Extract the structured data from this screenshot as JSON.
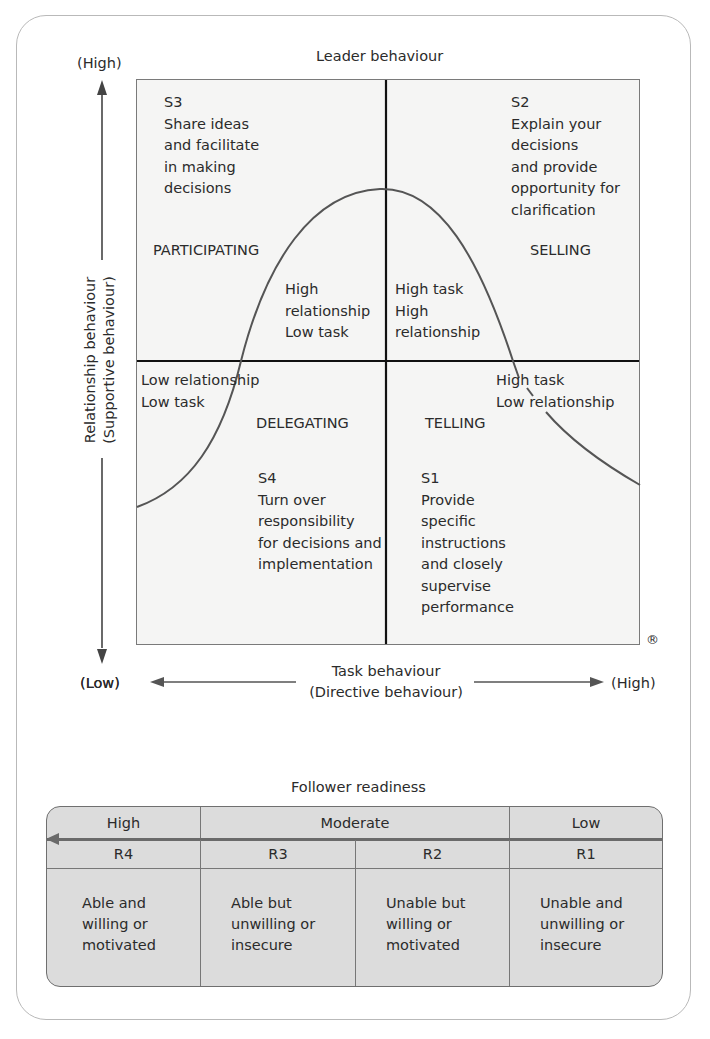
{
  "diagram": {
    "title": "Leader behaviour",
    "y_axis": {
      "label_line1": "Relationship behaviour",
      "label_line2": "(Supportive behaviour)",
      "high": "(High)",
      "low": "(Low)"
    },
    "x_axis": {
      "label_line1": "Task behaviour",
      "label_line2": "(Directive behaviour)",
      "low": "(Low)",
      "high": "(High)"
    },
    "registered_mark": "®",
    "quadrants": {
      "s3": {
        "code": "S3",
        "description": "Share ideas\nand facilitate\nin making\ndecisions",
        "style": "PARTICIPATING",
        "curve_label": "High\nrelationship\nLow task"
      },
      "s2": {
        "code": "S2",
        "description": "Explain your\ndecisions\nand provide\nopportunity for\nclarification",
        "style": "SELLING",
        "curve_label": "High task\nHigh\nrelationship"
      },
      "s4": {
        "code": "S4",
        "description": "Turn over\nresponsibility\nfor decisions and\nimplementation",
        "style": "DELEGATING",
        "curve_label": "Low relationship\nLow task"
      },
      "s1": {
        "code": "S1",
        "description": "Provide\nspecific\ninstructions\nand closely\nsupervise\nperformance",
        "style": "TELLING",
        "curve_label": "High task\nLow  relationship"
      }
    },
    "colors": {
      "grid_bg": "#f5f5f4",
      "curve": "#555555",
      "axis": "#111111",
      "table_bg": "#dcdcdc"
    }
  },
  "follower_readiness": {
    "title": "Follower readiness",
    "levels": [
      "High",
      "Moderate",
      "Low"
    ],
    "codes": [
      "R4",
      "R3",
      "R2",
      "R1"
    ],
    "descriptions": [
      "Able and\nwilling or\nmotivated",
      "Able but\nunwilling or\ninsecure",
      "Unable but\nwilling or\nmotivated",
      "Unable and\nunwilling or\ninsecure"
    ]
  }
}
